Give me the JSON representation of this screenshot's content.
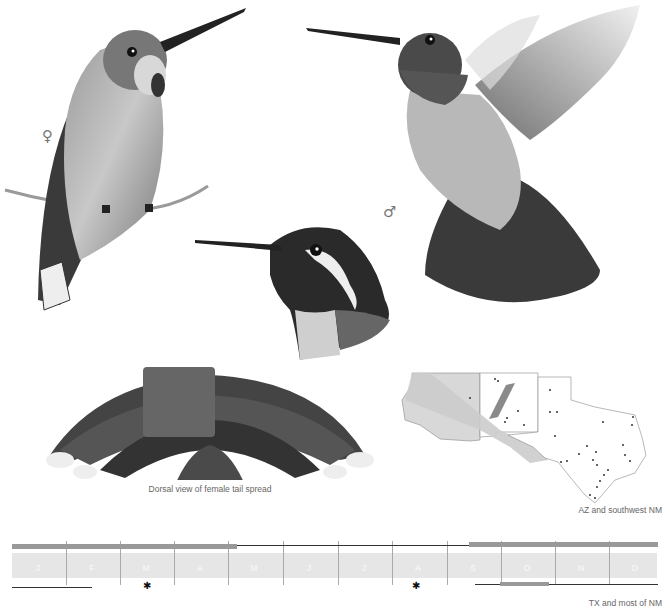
{
  "plate": {
    "female_symbol": "♀",
    "male_symbol": "♂",
    "figures": [
      {
        "name": "female-perched",
        "description": "Perched female hummingbird on twig"
      },
      {
        "name": "male-hovering",
        "description": "Hovering adult male hummingbird with spread tail"
      },
      {
        "name": "male-head",
        "description": "Male head portrait with dark gorget and white postocular stripe"
      },
      {
        "name": "female-tail-dorsal",
        "description": "Dorsal view of spread female tail"
      }
    ]
  },
  "captions": {
    "tail": "Dorsal view of female tail spread",
    "map_top": "AZ and southwest NM",
    "map_bottom": "TX and most of NM"
  },
  "map": {
    "regions": [
      "Arizona",
      "New Mexico",
      "Texas"
    ],
    "shaded_region_color": "#cfcfcf",
    "migration_band_color": "#8a8a8a"
  },
  "calendar": {
    "months": [
      "J",
      "F",
      "M",
      "A",
      "M",
      "J",
      "J",
      "A",
      "S",
      "O",
      "N",
      "D"
    ],
    "band_color": "#e6e6e6",
    "bar_color": "#999999",
    "line_color": "#333333",
    "marker": "✱"
  },
  "colors": {
    "background": "#ffffff",
    "ink": "#333333",
    "caption": "#666666"
  }
}
